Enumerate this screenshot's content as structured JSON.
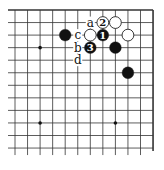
{
  "diagram": {
    "type": "go-board-fragment",
    "grid": {
      "columns": 12,
      "rows": 12,
      "x_start": 15,
      "y_start": 10,
      "spacing_x": 12.55,
      "spacing_y": 12.55,
      "line_color": "#333333",
      "edges": [
        "top",
        "right"
      ]
    },
    "star_points": [
      {
        "col": 2,
        "row": 3
      },
      {
        "col": 8,
        "row": 3
      },
      {
        "col": 2,
        "row": 9
      },
      {
        "col": 8,
        "row": 9
      }
    ],
    "stones": [
      {
        "color": "black",
        "col": 4,
        "row": 2,
        "label": ""
      },
      {
        "color": "white",
        "col": 6,
        "row": 2,
        "label": ""
      },
      {
        "color": "black",
        "col": 7,
        "row": 2,
        "label": "1"
      },
      {
        "color": "white",
        "col": 9,
        "row": 2,
        "label": ""
      },
      {
        "color": "white",
        "col": 7,
        "row": 1,
        "label": "2"
      },
      {
        "color": "white",
        "col": 8,
        "row": 1,
        "label": ""
      },
      {
        "color": "black",
        "col": 6,
        "row": 3,
        "label": "3"
      },
      {
        "color": "black",
        "col": 8,
        "row": 3,
        "label": ""
      },
      {
        "color": "black",
        "col": 9,
        "row": 5,
        "label": ""
      }
    ],
    "point_labels": [
      {
        "text": "a",
        "col": 6,
        "row": 1
      },
      {
        "text": "c",
        "col": 5,
        "row": 2
      },
      {
        "text": "b",
        "col": 5,
        "row": 3
      },
      {
        "text": "d",
        "col": 5,
        "row": 4
      }
    ],
    "colors": {
      "black_stone": "#111111",
      "white_stone": "#ffffff",
      "stone_outline": "#222222",
      "background": "#ffffff"
    }
  }
}
